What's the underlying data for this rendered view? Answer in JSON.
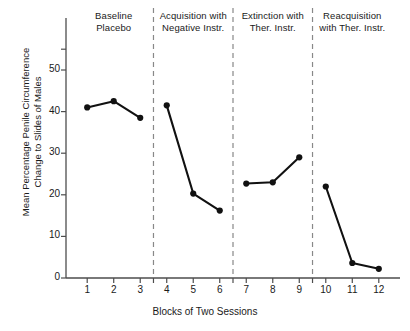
{
  "chart_data": {
    "type": "line",
    "title": "",
    "xlabel": "Blocks of Two Sessions",
    "ylabel": "Mean Percentage Penile Circumference Change to Slides of Males",
    "ylabel_lines": [
      "Mean Percentage Penile Circumference",
      "Change to Slides of Males"
    ],
    "x": [
      1,
      2,
      3,
      4,
      5,
      6,
      7,
      8,
      9,
      10,
      11,
      12
    ],
    "values": [
      41,
      42.5,
      38.5,
      41.5,
      20.3,
      16.2,
      22.7,
      23,
      29,
      22,
      3.6,
      2.2
    ],
    "xlim": [
      0.2,
      12.8
    ],
    "ylim": [
      0,
      55
    ],
    "ytick_labels": [
      "0",
      "10",
      "20",
      "30",
      "40",
      "50"
    ],
    "yticks": [
      0,
      10,
      20,
      30,
      40,
      50
    ],
    "xtick_labels": [
      "1",
      "2",
      "3",
      "4",
      "5",
      "6",
      "7",
      "8",
      "9",
      "10",
      "11",
      "12"
    ],
    "grid": false,
    "legend": "none",
    "marker": "filled-circle",
    "line_color": "#111111",
    "marker_color": "#111111",
    "axis_color": "#555555",
    "separator_color": "#888888",
    "separator_style": "dashed",
    "separators_at_x": [
      3.5,
      6.5,
      9.5
    ],
    "series": [
      {
        "name": "Baseline Placebo",
        "x": [
          1,
          2,
          3
        ],
        "values": [
          41,
          42.5,
          38.5
        ]
      },
      {
        "name": "Acquisition with Negative Instr.",
        "x": [
          4,
          5,
          6
        ],
        "values": [
          41.5,
          20.3,
          16.2
        ]
      },
      {
        "name": "Extinction with Ther. Instr.",
        "x": [
          7,
          8,
          9
        ],
        "values": [
          22.7,
          23,
          29
        ]
      },
      {
        "name": "Reacquisition with Ther. Instr.",
        "x": [
          10,
          11,
          12
        ],
        "values": [
          22,
          3.6,
          2.2
        ]
      }
    ],
    "annotations": [
      {
        "id": "phase-1",
        "lines": [
          "Baseline",
          "Placebo"
        ],
        "x_center": 2
      },
      {
        "id": "phase-2",
        "lines": [
          "Acquisition with",
          "Negative Instr."
        ],
        "x_center": 5
      },
      {
        "id": "phase-3",
        "lines": [
          "Extinction with",
          "Ther. Instr."
        ],
        "x_center": 8
      },
      {
        "id": "phase-4",
        "lines": [
          "Reacquisition",
          "with Ther. Instr."
        ],
        "x_center": 11
      }
    ]
  },
  "phases": [
    {
      "line1": "Baseline",
      "line2": "Placebo"
    },
    {
      "line1": "Acquisition with",
      "line2": "Negative Instr."
    },
    {
      "line1": "Extinction with",
      "line2": "Ther. Instr."
    },
    {
      "line1": "Reacquisition",
      "line2": "with Ther. Instr."
    }
  ],
  "axes": {
    "x_title": "Blocks of Two Sessions",
    "y_title_line1": "Mean Percentage Penile Circumference",
    "y_title_line2": "Change to Slides of Males",
    "y_ticks": [
      "50",
      "40",
      "30",
      "20",
      "10",
      "0"
    ],
    "x_ticks": [
      "1",
      "2",
      "3",
      "4",
      "5",
      "6",
      "7",
      "8",
      "9",
      "10",
      "11",
      "12"
    ]
  }
}
